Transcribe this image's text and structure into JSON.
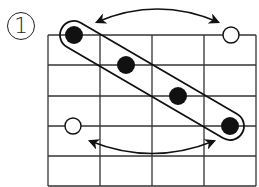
{
  "figure": {
    "label": "1",
    "grid": {
      "columns": 4,
      "rows": 5,
      "x_lines": [
        48,
        100,
        152,
        204,
        256
      ],
      "y_lines": [
        35,
        65,
        96,
        126,
        156,
        186
      ],
      "line_color": "#333333"
    },
    "filled_dots": [
      {
        "cx": 74,
        "cy": 35
      },
      {
        "cx": 126,
        "cy": 65
      },
      {
        "cx": 178,
        "cy": 96
      },
      {
        "cx": 230,
        "cy": 126
      }
    ],
    "hollow_circles": [
      {
        "cx": 231,
        "cy": 35
      },
      {
        "cx": 73,
        "cy": 126
      }
    ],
    "capsule": {
      "x1": 74,
      "y1": 35,
      "x2": 230,
      "y2": 126,
      "half_width": 14
    },
    "arrows": [
      {
        "name": "top-double-arrow",
        "x1": 97,
        "y1": 22,
        "x2": 218,
        "y2": 22,
        "ctrl_y": -4
      },
      {
        "name": "bottom-double-arrow",
        "x1": 90,
        "y1": 141,
        "x2": 214,
        "y2": 141,
        "ctrl_y": 166
      }
    ],
    "colors": {
      "ink": "#111111",
      "background": "#ffffff"
    }
  }
}
